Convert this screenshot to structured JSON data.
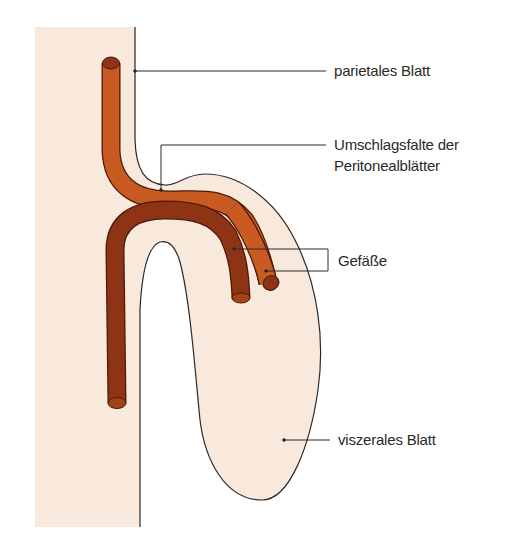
{
  "diagram": {
    "type": "anatomical-schematic",
    "colors": {
      "tissue": "#f9e9dc",
      "vessel_light": "#c85a22",
      "vessel_dark": "#8e3415",
      "vessel_outline": "#4a1a08",
      "line": "#2a2a2a",
      "background": "#ffffff"
    },
    "labels": [
      {
        "id": "parietal",
        "text": "parietales Blatt"
      },
      {
        "id": "fold_line1",
        "text": "Umschlagsfalte der"
      },
      {
        "id": "fold_line2",
        "text": "Peritonealblätter"
      },
      {
        "id": "vessels",
        "text": "Gefäße"
      },
      {
        "id": "visceral",
        "text": "viszerales Blatt"
      }
    ]
  }
}
